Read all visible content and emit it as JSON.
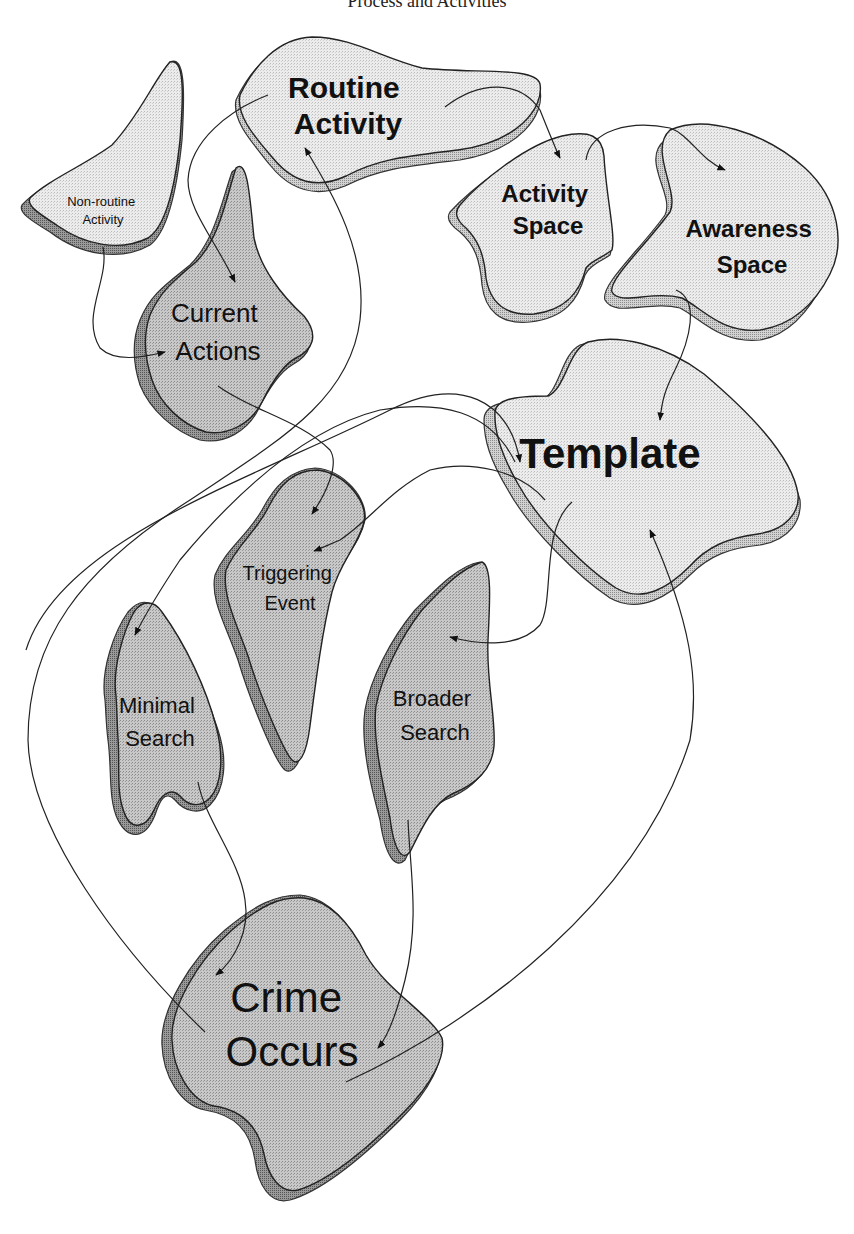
{
  "title": "Process and Activities",
  "colors": {
    "light_fill": "#e6e6e6",
    "light_shadow": "#c4c4c4",
    "dark_fill": "#bdbdbd",
    "dark_shadow": "#8e8e8e",
    "line": "#222222",
    "background": "#ffffff"
  },
  "nodes": [
    {
      "id": "routine-activity",
      "lines": [
        "Routine",
        "Activity"
      ],
      "style": "bold-light"
    },
    {
      "id": "non-routine-activity",
      "lines": [
        "Non-routine",
        "Activity"
      ],
      "style": "small-dark"
    },
    {
      "id": "current-actions",
      "lines": [
        "Current",
        "Actions"
      ],
      "style": "dark"
    },
    {
      "id": "activity-space",
      "lines": [
        "Activity",
        "Space"
      ],
      "style": "bold-light"
    },
    {
      "id": "awareness-space",
      "lines": [
        "Awareness",
        "Space"
      ],
      "style": "bold-light"
    },
    {
      "id": "template",
      "lines": [
        "Template"
      ],
      "style": "bold-light"
    },
    {
      "id": "triggering-event",
      "lines": [
        "Triggering",
        "Event"
      ],
      "style": "dark"
    },
    {
      "id": "minimal-search",
      "lines": [
        "Minimal",
        "Search"
      ],
      "style": "dark"
    },
    {
      "id": "broader-search",
      "lines": [
        "Broader",
        "Search"
      ],
      "style": "dark"
    },
    {
      "id": "crime-occurs",
      "lines": [
        "Crime",
        "Occurs"
      ],
      "style": "dark-large"
    }
  ],
  "edges": [
    {
      "from": "non-routine-activity",
      "to": "current-actions"
    },
    {
      "from": "routine-activity",
      "to": "current-actions"
    },
    {
      "from": "routine-activity",
      "to": "activity-space"
    },
    {
      "from": "activity-space",
      "to": "awareness-space"
    },
    {
      "from": "awareness-space",
      "to": "template"
    },
    {
      "from": "current-actions",
      "to": "triggering-event"
    },
    {
      "from": "current-actions",
      "to": "template"
    },
    {
      "from": "template",
      "to": "triggering-event"
    },
    {
      "from": "template",
      "to": "minimal-search"
    },
    {
      "from": "template",
      "to": "broader-search"
    },
    {
      "from": "minimal-search",
      "to": "crime-occurs"
    },
    {
      "from": "broader-search",
      "to": "crime-occurs"
    },
    {
      "from": "crime-occurs",
      "to": "template"
    },
    {
      "from": "crime-occurs",
      "to": "routine-activity"
    },
    {
      "from": "broader-search",
      "to": "template"
    }
  ]
}
